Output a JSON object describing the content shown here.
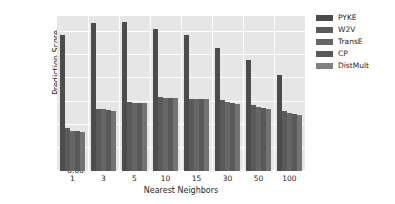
{
  "chart_data": {
    "type": "bar",
    "title": "",
    "xlabel": "Nearest Neighbors",
    "ylabel": "Prediction Score",
    "categories": [
      "1",
      "3",
      "5",
      "10",
      "15",
      "30",
      "50",
      "100"
    ],
    "ylim": [
      0.0,
      0.335
    ],
    "yticks": [
      "0.00",
      "0.05",
      "0.10",
      "0.15",
      "0.20",
      "0.25",
      "0.30"
    ],
    "ytick_values": [
      0.0,
      0.05,
      0.1,
      0.15,
      0.2,
      0.25,
      0.3
    ],
    "grid": true,
    "legend_position": "right",
    "series": [
      {
        "name": "PYKE",
        "color": "#4c4c4c",
        "values": [
          0.293,
          0.32,
          0.322,
          0.307,
          0.295,
          0.265,
          0.24,
          0.207
        ]
      },
      {
        "name": "W2V",
        "color": "#5a5a5a",
        "values": [
          0.093,
          0.135,
          0.149,
          0.159,
          0.156,
          0.153,
          0.143,
          0.129
        ]
      },
      {
        "name": "TransE",
        "color": "#666666",
        "values": [
          0.086,
          0.133,
          0.148,
          0.158,
          0.156,
          0.149,
          0.139,
          0.125
        ]
      },
      {
        "name": "CP",
        "color": "#595959",
        "values": [
          0.086,
          0.131,
          0.148,
          0.158,
          0.155,
          0.146,
          0.136,
          0.123
        ]
      },
      {
        "name": "DistMult",
        "color": "#737373",
        "values": [
          0.085,
          0.13,
          0.147,
          0.157,
          0.155,
          0.145,
          0.135,
          0.122
        ]
      }
    ]
  },
  "legend": {
    "items": [
      {
        "label": "PYKE",
        "swatch": "#4c4c4c"
      },
      {
        "label": "W2V",
        "swatch": "#5a5a5a"
      },
      {
        "label": "TransE",
        "swatch": "#666666"
      },
      {
        "label": "CP",
        "swatch": "#595959"
      },
      {
        "label": "DistMult",
        "swatch": "#808080"
      }
    ]
  },
  "style": {
    "plot_background": "#e6e6e6",
    "grid_color": "#ffffff",
    "figure_background": "#ffffff",
    "text_color": "#262626"
  }
}
